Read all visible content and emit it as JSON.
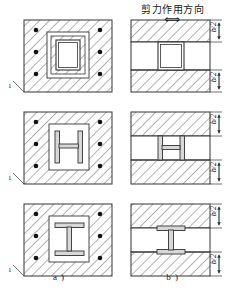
{
  "figure": {
    "title": "剪力作用方向",
    "shear_arrow": "⟺",
    "captions": {
      "left": "a )",
      "right": "b )"
    },
    "section_mark": "1",
    "dimension_label": "b/2",
    "colors": {
      "line": "#333333",
      "hatch": "#555555",
      "rebar": "#111111",
      "background": "#ffffff",
      "steel_fill": "#d8d8d8"
    }
  },
  "rows": [
    {
      "name": "box-section",
      "shape": "hollow box",
      "left_view": {
        "outer": "hatched concrete square",
        "middle": "plain band",
        "core": "hollow square steel box",
        "rebar_count": 8
      },
      "right_view": {
        "bands": [
          "hatched",
          "plain",
          "hatched"
        ],
        "core": "hollow square steel box",
        "dims": [
          "b/2",
          "b/2"
        ]
      }
    },
    {
      "name": "h-section",
      "shape": "H shape (web horizontal)",
      "left_view": {
        "outer": "hatched concrete square",
        "middle": "plain square",
        "core": "H steel section",
        "rebar_count": 8
      },
      "right_view": {
        "bands": [
          "hatched",
          "plain",
          "hatched"
        ],
        "core": "H steel section",
        "dims": [
          "b/2",
          "b/2"
        ]
      }
    },
    {
      "name": "i-section",
      "shape": "I beam (web vertical)",
      "left_view": {
        "outer": "hatched concrete square",
        "middle": "plain square",
        "core": "I steel section",
        "rebar_count": 8
      },
      "right_view": {
        "bands": [
          "hatched",
          "plain",
          "hatched"
        ],
        "core": "I steel section",
        "dims": [
          "b/2",
          "b/2"
        ]
      }
    }
  ]
}
